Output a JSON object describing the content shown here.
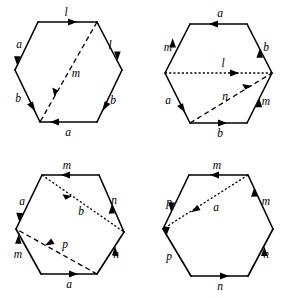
{
  "figure": {
    "panel_count": 4,
    "stroke_color": "#000000",
    "background_color": "#ffffff"
  },
  "panels": [
    {
      "id": "top-left",
      "name": "hexagon-top-left",
      "edges": [
        {
          "name": "edge-top",
          "label": "l",
          "direction": "right"
        },
        {
          "name": "edge-upper-left",
          "label": "a",
          "direction": "down-left"
        },
        {
          "name": "edge-lower-left",
          "label": "b",
          "direction": "down-right"
        },
        {
          "name": "edge-bottom",
          "label": "a",
          "direction": "left"
        },
        {
          "name": "edge-lower-right",
          "label": "b",
          "direction": "up-left"
        },
        {
          "name": "edge-upper-right",
          "label": "l",
          "direction": "down-right"
        }
      ],
      "diagonals": [
        {
          "name": "diagonal-m",
          "label": "m",
          "style": "dashed",
          "direction": "down-left",
          "from": "top-right-vertex",
          "to": "bottom-left-vertex"
        }
      ]
    },
    {
      "id": "top-right",
      "name": "hexagon-top-right",
      "edges": [
        {
          "name": "edge-top",
          "label": "a",
          "direction": "left"
        },
        {
          "name": "edge-upper-left",
          "label": "m",
          "direction": "up-right"
        },
        {
          "name": "edge-lower-left",
          "label": "a",
          "direction": "down-right"
        },
        {
          "name": "edge-bottom",
          "label": "b",
          "direction": "right"
        },
        {
          "name": "edge-lower-right",
          "label": "m",
          "direction": "up-right"
        },
        {
          "name": "edge-upper-right",
          "label": "b",
          "direction": "up-left"
        }
      ],
      "diagonals": [
        {
          "name": "diagonal-l",
          "label": "l",
          "style": "dotted",
          "direction": "right",
          "from": "left-vertex",
          "to": "right-vertex"
        },
        {
          "name": "diagonal-n",
          "label": "n",
          "style": "dashed",
          "direction": "up-right",
          "from": "bottom-left-vertex",
          "to": "right-vertex"
        }
      ]
    },
    {
      "id": "bottom-left",
      "name": "hexagon-bottom-left",
      "edges": [
        {
          "name": "edge-top",
          "label": "m",
          "direction": "left"
        },
        {
          "name": "edge-upper-left",
          "label": "a",
          "direction": "down-left"
        },
        {
          "name": "edge-lower-left",
          "label": "m",
          "direction": "up-left"
        },
        {
          "name": "edge-bottom",
          "label": "a",
          "direction": "right"
        },
        {
          "name": "edge-lower-right",
          "label": "n",
          "direction": "up-right"
        },
        {
          "name": "edge-upper-right",
          "label": "n",
          "direction": "up-left"
        }
      ],
      "diagonals": [
        {
          "name": "diagonal-b",
          "label": "b",
          "style": "dotted",
          "direction": "down-right",
          "from": "top-left-vertex",
          "to": "right-vertex"
        },
        {
          "name": "diagonal-p",
          "label": "p",
          "style": "dashed",
          "direction": "up-left",
          "from": "bottom-right-vertex",
          "to": "left-vertex"
        }
      ]
    },
    {
      "id": "bottom-right",
      "name": "hexagon-bottom-right",
      "edges": [
        {
          "name": "edge-top",
          "label": "m",
          "direction": "left"
        },
        {
          "name": "edge-upper-left",
          "label": "p",
          "direction": "up-right"
        },
        {
          "name": "edge-lower-left",
          "label": "p",
          "direction": "up-left"
        },
        {
          "name": "edge-bottom",
          "label": "n",
          "direction": "right"
        },
        {
          "name": "edge-lower-right",
          "label": "n",
          "direction": "up-right"
        },
        {
          "name": "edge-upper-right",
          "label": "m",
          "direction": "up-left"
        }
      ],
      "diagonals": [
        {
          "name": "diagonal-a",
          "label": "a",
          "style": "dotted",
          "direction": "down-left",
          "from": "top-right-vertex",
          "to": "left-vertex"
        }
      ]
    }
  ],
  "labels": {
    "tl": {
      "top": "l",
      "upper_left": "a",
      "lower_left": "b",
      "bottom": "a",
      "lower_right": "b",
      "upper_right": "l",
      "diag_m": "m"
    },
    "tr": {
      "top": "a",
      "upper_left": "m",
      "lower_left": "a",
      "bottom": "b",
      "lower_right": "m",
      "upper_right": "b",
      "diag_l": "l",
      "diag_n": "n"
    },
    "bl": {
      "top": "m",
      "upper_left": "a",
      "lower_left": "m",
      "bottom": "a",
      "lower_right": "n",
      "upper_right": "n",
      "diag_b": "b",
      "diag_p": "p"
    },
    "br": {
      "top": "m",
      "upper_left": "p",
      "lower_left": "p",
      "bottom": "n",
      "lower_right": "n",
      "upper_right": "m",
      "diag_a": "a"
    }
  }
}
